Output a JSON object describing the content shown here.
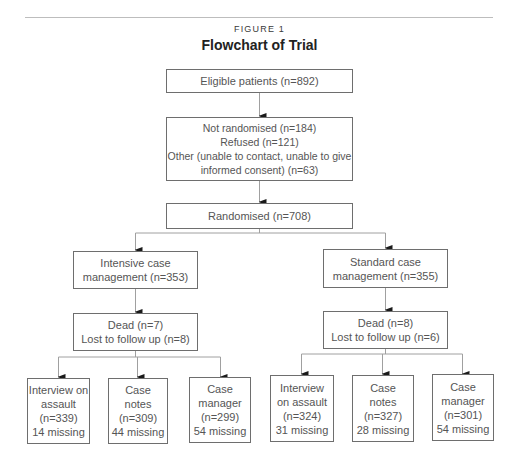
{
  "figure": {
    "label": "FIGURE 1",
    "title": "Flowchart of Trial"
  },
  "flow": {
    "eligible": {
      "lines": [
        "Eligible patients (n=892)"
      ]
    },
    "not_randomised": {
      "lines": [
        "Not randomised (n=184)",
        "Refused (n=121)",
        "Other (unable to contact, unable to give",
        "informed consent) (n=63)"
      ]
    },
    "randomised": {
      "lines": [
        "Randomised (n=708)"
      ]
    },
    "intensive": {
      "arm": {
        "lines": [
          "Intensive case",
          "management (n=353)"
        ]
      },
      "attrition": {
        "lines": [
          "Dead (n=7)",
          "Lost to follow up (n=8)"
        ]
      },
      "outcomes": [
        {
          "lines": [
            "Interview on",
            "assault",
            "(n=339)",
            "14 missing"
          ]
        },
        {
          "lines": [
            "Case",
            "notes",
            "(n=309)",
            "44 missing"
          ]
        },
        {
          "lines": [
            "Case",
            "manager",
            "(n=299)",
            "54 missing"
          ]
        }
      ]
    },
    "standard": {
      "arm": {
        "lines": [
          "Standard case",
          "management (n=355)"
        ]
      },
      "attrition": {
        "lines": [
          "Dead (n=8)",
          "Lost to follow up (n=6)"
        ]
      },
      "outcomes": [
        {
          "lines": [
            "Interview",
            "on assault",
            "(n=324)",
            "31 missing"
          ]
        },
        {
          "lines": [
            "Case",
            "notes",
            "(n=327)",
            "28 missing"
          ]
        },
        {
          "lines": [
            "Case",
            "manager",
            "(n=301)",
            "54 missing"
          ]
        }
      ]
    }
  },
  "colors": {
    "box_border": "#6e6e6e",
    "connector": "#a0a0a0",
    "arrowhead": "#1a1a1a",
    "text": "#555555"
  }
}
